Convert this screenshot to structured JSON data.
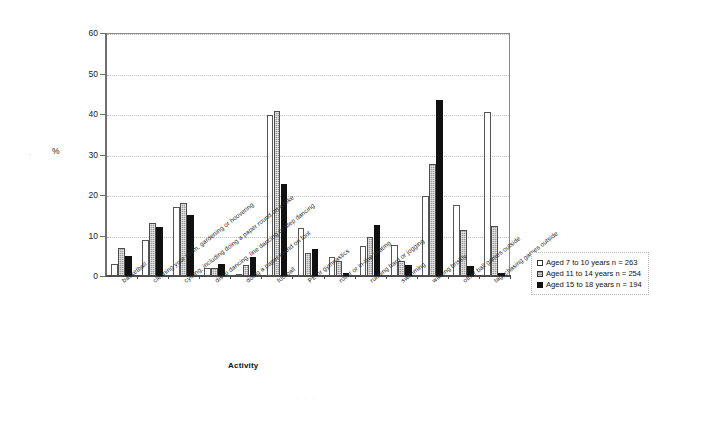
{
  "chart_data": {
    "type": "bar",
    "title": "",
    "xlabel": "Activity",
    "ylabel": "%",
    "ylim": [
      0,
      60
    ],
    "ytick_values": [
      0,
      10,
      20,
      30,
      40,
      50,
      60
    ],
    "ytick_labels": [
      "0",
      "10",
      "20",
      "30",
      "40",
      "50",
      "60"
    ],
    "grid": true,
    "legend_position": "right",
    "categories": [
      "basketball",
      "cleaning your room, gardening or hoovering",
      "cycling, including doing a paper round on a bike",
      "disco dancing, line dancing or step dancing",
      "doing a paper round on foot",
      "football",
      "PE or gymnastics",
      "roller or in-line skating",
      "running hard or jogging",
      "swimming",
      "walking briskly",
      "other ball games outside",
      "tag, chasing games outside"
    ],
    "series": [
      {
        "name": "Aged 7 to 10 years n = 263",
        "color": "#ffffff",
        "values": [
          3.0,
          9.0,
          17.0,
          2.0,
          0.4,
          39.8,
          11.8,
          4.6,
          7.5,
          7.6,
          19.7,
          17.5,
          40.5
        ]
      },
      {
        "name": "Aged 11 to 14 years n = 254",
        "color": "#9b9b9b",
        "values": [
          7.0,
          13.0,
          18.0,
          1.9,
          2.8,
          40.7,
          5.7,
          3.7,
          9.6,
          3.6,
          27.6,
          11.4,
          12.4
        ]
      },
      {
        "name": "Aged 15 to 18 years n = 194",
        "color": "#111111",
        "values": [
          5.0,
          12.0,
          15.0,
          3.0,
          4.8,
          22.8,
          6.7,
          0.8,
          12.7,
          2.6,
          43.5,
          2.5,
          0.8
        ]
      }
    ]
  },
  "legend": {
    "items": [
      "Aged 7 to 10 years n = 263",
      "Aged 11 to 14 years n = 254",
      "Aged 15 to 18 years n = 194"
    ]
  },
  "artifacts": {
    "left_mark": "·",
    "bottom_mark": "· · ·"
  }
}
